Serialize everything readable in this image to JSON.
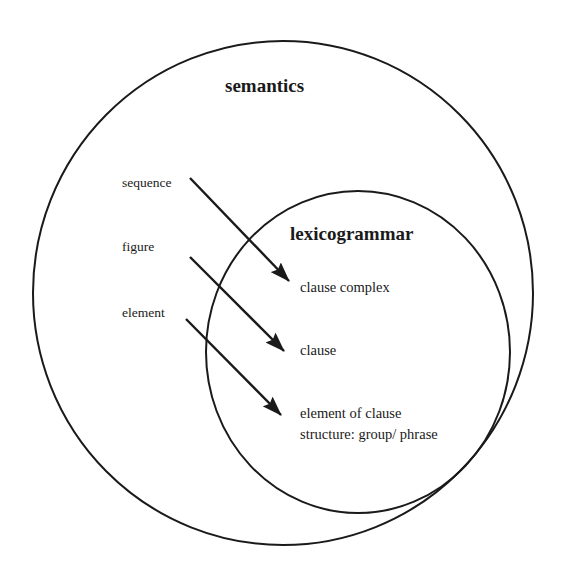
{
  "diagram": {
    "outer_set": {
      "label": "semantics",
      "shape": {
        "cx": 283,
        "cy": 293,
        "rx": 250,
        "ry": 252
      }
    },
    "inner_set": {
      "label": "lexicogrammar",
      "shape": {
        "cx": 358,
        "cy": 352,
        "rx": 152,
        "ry": 161
      }
    },
    "semantic_units": [
      {
        "label": "sequence"
      },
      {
        "label": "figure"
      },
      {
        "label": "element"
      }
    ],
    "grammatical_units": [
      {
        "label": "clause complex"
      },
      {
        "label": "clause"
      },
      {
        "label": "element of clause",
        "label_line2": "structure: group/ phrase"
      }
    ],
    "arrows": [
      {
        "from": "sequence",
        "to": "clause complex",
        "x1": 190,
        "y1": 178,
        "x2": 289,
        "y2": 281
      },
      {
        "from": "figure",
        "to": "clause",
        "x1": 190,
        "y1": 257,
        "x2": 284,
        "y2": 351
      },
      {
        "from": "element",
        "to": "element of clause structure: group/ phrase",
        "x1": 186,
        "y1": 319,
        "x2": 281,
        "y2": 415
      }
    ],
    "colors": {
      "stroke": "#1a1a1a",
      "background": "#ffffff"
    }
  }
}
